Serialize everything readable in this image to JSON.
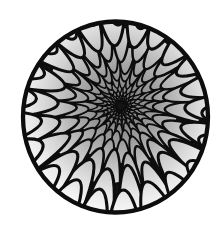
{
  "image": {
    "description": "Black-and-white ink drawing of a circle lined with overlapping scale-like cells that shrink and darken toward an off-center vanishing point, creating a tunnel or funnel illusion",
    "background_color": "#ffffff",
    "outline_color": "#0d0d0d",
    "gap_color": "#141414",
    "canvas": {
      "width": 223,
      "height": 235
    },
    "circle": {
      "cx": 115.5,
      "cy": 117,
      "rx": 92.5,
      "ry": 95.5,
      "stroke_width": 4.3
    },
    "vanishing_point": {
      "x": 121,
      "y": 106
    },
    "pattern": {
      "ring_start_radius": 5,
      "ring_growth": 1.36,
      "max_radius": 112,
      "cell_width_factor": 0.92,
      "min_cells": 9,
      "max_cells": 26,
      "tip_factor": 0.78,
      "seed": 11
    },
    "shading": {
      "gradient_radius": 110,
      "gradient_stops": [
        {
          "offset": 0,
          "color": "#727272"
        },
        {
          "offset": 0.16,
          "color": "#868686"
        },
        {
          "offset": 0.38,
          "color": "#a6a6a6"
        },
        {
          "offset": 0.62,
          "color": "#cdcdcd"
        },
        {
          "offset": 0.82,
          "color": "#e9e9e9"
        },
        {
          "offset": 1,
          "color": "#f9f9f9"
        }
      ]
    }
  }
}
